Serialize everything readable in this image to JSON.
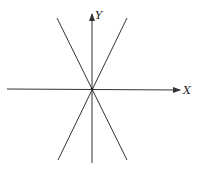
{
  "diagram": {
    "axes": {
      "x_label": "X",
      "y_label": "Y"
    },
    "lines": [
      {
        "name": "line-negative-slope",
        "from": [
          57,
          18
        ],
        "to": [
          127,
          160
        ]
      },
      {
        "name": "line-positive-slope",
        "from": [
          127,
          18
        ],
        "to": [
          58,
          160
        ]
      }
    ],
    "colors": {
      "stroke": "#333333",
      "background": "#ffffff"
    }
  }
}
